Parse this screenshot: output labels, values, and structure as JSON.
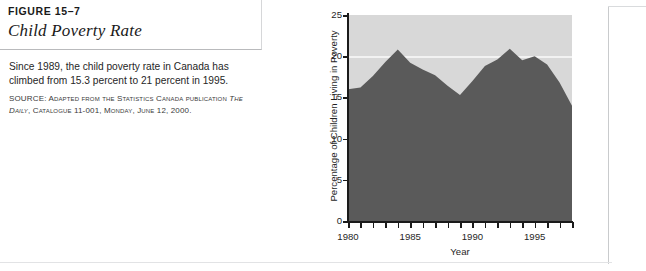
{
  "figure": {
    "number": "FIGURE 15–7",
    "title": "Child Poverty Rate",
    "description": "Since 1989, the child poverty rate in Canada has climbed from 15.3 percent to 21 percent in 1995.",
    "source_label": "SOURCE:",
    "source_text_1": "Adapted from the Statistics Canada publication ",
    "source_italic": "The Daily",
    "source_text_2": ", Catalogue 11-001, Monday, June 12, 2000."
  },
  "colors": {
    "area_fill": "#5a5a5a",
    "plot_background": "#d8d8d8",
    "gridline": "#f2f2f2",
    "axis": "#1a1a1a",
    "page_background": "#ffffff",
    "frame_line": "#c9cbcd"
  },
  "chart_data": {
    "type": "area",
    "title": "Child Poverty Rate",
    "xlabel": "Year",
    "ylabel": "Percentage of Children Living in Poverty",
    "xlim": [
      1980,
      1998
    ],
    "ylim": [
      0,
      25
    ],
    "ytick_labels": [
      "0",
      "5",
      "10",
      "15",
      "20",
      "25"
    ],
    "ytick_values": [
      0,
      5,
      10,
      15,
      20,
      25
    ],
    "xtick_labels": [
      "1980",
      "1985",
      "1990",
      "1995"
    ],
    "xtick_values": [
      1980,
      1985,
      1990,
      1995
    ],
    "xminor_step": 1,
    "grid": "horizontal-line-at-20",
    "legend": "none",
    "x": [
      1980,
      1981,
      1982,
      1983,
      1984,
      1985,
      1986,
      1987,
      1988,
      1989,
      1990,
      1991,
      1992,
      1993,
      1994,
      1995,
      1996,
      1997,
      1998
    ],
    "values": [
      16.0,
      16.2,
      17.6,
      19.3,
      20.8,
      19.2,
      18.4,
      17.7,
      16.4,
      15.3,
      17.0,
      18.8,
      19.6,
      20.9,
      19.5,
      20.0,
      19.0,
      16.8,
      14.0
    ],
    "series": [
      {
        "name": "Percentage of children living in poverty",
        "values": [
          16.0,
          16.2,
          17.6,
          19.3,
          20.8,
          19.2,
          18.4,
          17.7,
          16.4,
          15.3,
          17.0,
          18.8,
          19.6,
          20.9,
          19.5,
          20.0,
          19.0,
          16.8,
          14.0
        ]
      }
    ]
  }
}
